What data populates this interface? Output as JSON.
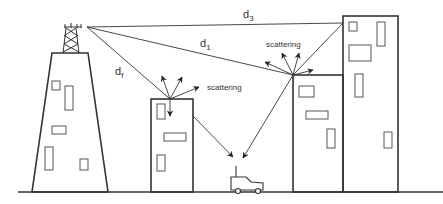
{
  "diagram": {
    "type": "multipath-propagation",
    "labels": {
      "d3": {
        "main": "d",
        "sub": "3"
      },
      "d1": {
        "main": "d",
        "sub": "1"
      },
      "df": {
        "main": "d",
        "sub": "f"
      },
      "scattering_left": "scattering",
      "scattering_right": "scattering"
    },
    "elements": [
      "transmitter-tower",
      "building-left-short",
      "building-middle",
      "building-right-short",
      "building-right-tall",
      "car-receiver",
      "ground-line"
    ],
    "stroke_color": "#333333",
    "background": "#ffffff"
  }
}
